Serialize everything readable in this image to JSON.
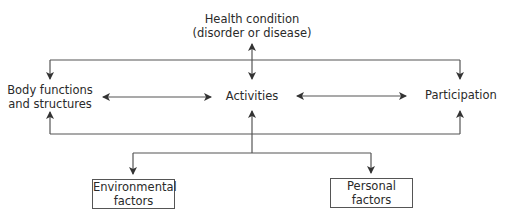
{
  "diagram": {
    "nodes": {
      "health_condition": {
        "line1": "Health condition",
        "line2": "(disorder or disease)"
      },
      "body_functions": {
        "line1": "Body functions",
        "line2": "and structures"
      },
      "activities": {
        "label": "Activities"
      },
      "participation": {
        "label": "Participation"
      },
      "environmental_factors": {
        "line1": "Environmental",
        "line2": "factors"
      },
      "personal_factors": {
        "line1": "Personal",
        "line2": "factors"
      }
    },
    "edges": [
      {
        "from": "health_condition",
        "to": "activities",
        "type": "bidirectional"
      },
      {
        "from": "health_condition",
        "to": "body_functions",
        "type": "directed"
      },
      {
        "from": "health_condition",
        "to": "participation",
        "type": "directed"
      },
      {
        "from": "body_functions",
        "to": "activities",
        "type": "bidirectional"
      },
      {
        "from": "activities",
        "to": "participation",
        "type": "bidirectional"
      },
      {
        "from": "contextual_factors",
        "to": "body_functions",
        "type": "directed"
      },
      {
        "from": "contextual_factors",
        "to": "activities",
        "type": "directed"
      },
      {
        "from": "contextual_factors",
        "to": "participation",
        "type": "directed"
      },
      {
        "from": "activities",
        "to": "environmental_factors",
        "type": "directed"
      },
      {
        "from": "activities",
        "to": "personal_factors",
        "type": "directed"
      }
    ],
    "colors": {
      "line": "#555555",
      "text": "#2a2a2a"
    }
  }
}
